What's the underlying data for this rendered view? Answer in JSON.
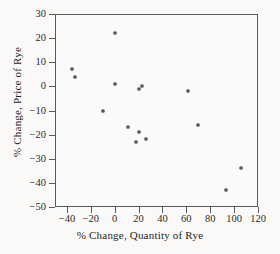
{
  "chart_data": {
    "type": "scatter",
    "title": "",
    "xlabel": "% Change, Quantity of Rye",
    "ylabel": "% Change, Price of Rye",
    "xlim": [
      -50,
      120
    ],
    "ylim": [
      -50,
      30
    ],
    "xticks": [
      -40,
      -20,
      0,
      20,
      40,
      60,
      80,
      100,
      120
    ],
    "yticks": [
      30,
      20,
      10,
      0,
      -10,
      -20,
      -30,
      -40,
      -50
    ],
    "xticklabels": [
      "−40",
      "−20",
      "0",
      "20",
      "40",
      "60",
      "80",
      "100",
      "120"
    ],
    "yticklabels": [
      "30",
      "20",
      "10",
      "0",
      "−10",
      "−20",
      "−30",
      "−40",
      "−50"
    ],
    "grid": false,
    "legend": null,
    "marker": "circle",
    "marker_color": "#55555a",
    "points": [
      {
        "x": -36,
        "y": 7
      },
      {
        "x": -33,
        "y": 4
      },
      {
        "x": -10,
        "y": -10
      },
      {
        "x": 0,
        "y": 22
      },
      {
        "x": 0,
        "y": 1
      },
      {
        "x": 11,
        "y": -17
      },
      {
        "x": 18,
        "y": -23
      },
      {
        "x": 20,
        "y": -19
      },
      {
        "x": 20,
        "y": -1
      },
      {
        "x": 23,
        "y": 0
      },
      {
        "x": 26,
        "y": -22
      },
      {
        "x": 61,
        "y": -2
      },
      {
        "x": 70,
        "y": -16
      },
      {
        "x": 93,
        "y": -43
      },
      {
        "x": 106,
        "y": -34
      }
    ]
  },
  "colors": {
    "page_background": "#f2f0ee",
    "figure_background": "#faf9f7",
    "axis": "#5a5a5a",
    "text": "#1f1f1f",
    "marker": "#55555a"
  }
}
